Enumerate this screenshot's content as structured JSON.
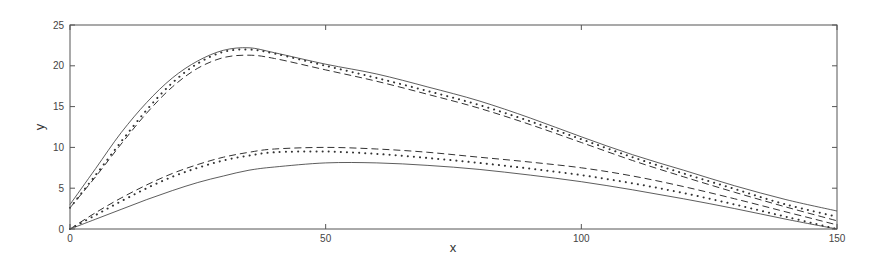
{
  "chart_data": {
    "type": "line",
    "title": "",
    "xlabel": "x",
    "ylabel": "y",
    "xlim": [
      0,
      150
    ],
    "ylim": [
      0,
      25
    ],
    "xticks": [
      0,
      50,
      100,
      150
    ],
    "yticks": [
      0,
      5,
      10,
      15,
      20,
      25
    ],
    "grid": false,
    "legend": null,
    "x": [
      0,
      5,
      10,
      15,
      20,
      25,
      30,
      35,
      40,
      50,
      60,
      70,
      80,
      90,
      100,
      110,
      120,
      130,
      140,
      150
    ],
    "series": [
      {
        "name": "upper-solid",
        "style": "solid",
        "group": "upper",
        "values": [
          3.0,
          7.4,
          11.8,
          15.5,
          18.5,
          20.6,
          21.9,
          22.2,
          21.6,
          20.2,
          19.0,
          17.4,
          15.7,
          13.6,
          11.3,
          9.1,
          7.2,
          5.3,
          3.6,
          2.2
        ]
      },
      {
        "name": "upper-dotted",
        "style": "dotted",
        "group": "upper",
        "values": [
          2.6,
          6.6,
          10.7,
          14.6,
          17.9,
          20.3,
          21.7,
          22.0,
          21.5,
          20.0,
          18.5,
          16.9,
          15.2,
          13.2,
          11.0,
          8.8,
          6.8,
          4.9,
          3.0,
          1.5
        ]
      },
      {
        "name": "upper-dashed",
        "style": "dashed",
        "group": "upper",
        "values": [
          2.6,
          6.4,
          10.4,
          14.2,
          17.4,
          19.7,
          21.0,
          21.3,
          20.9,
          19.5,
          18.1,
          16.5,
          14.8,
          12.8,
          10.6,
          8.4,
          6.4,
          4.5,
          2.7,
          1.0
        ]
      },
      {
        "name": "lower-dashed",
        "style": "dashed",
        "group": "lower",
        "values": [
          0.0,
          2.0,
          3.8,
          5.4,
          6.8,
          7.9,
          8.8,
          9.4,
          9.8,
          10.0,
          9.8,
          9.4,
          8.8,
          8.2,
          7.5,
          6.5,
          5.2,
          3.7,
          2.1,
          0.5
        ]
      },
      {
        "name": "lower-dotted",
        "style": "dotted",
        "group": "lower",
        "values": [
          0.0,
          1.7,
          3.4,
          5.0,
          6.4,
          7.5,
          8.4,
          9.0,
          9.4,
          9.5,
          9.2,
          8.7,
          8.1,
          7.4,
          6.6,
          5.6,
          4.4,
          3.0,
          1.5,
          0.0
        ]
      },
      {
        "name": "lower-solid",
        "style": "solid",
        "group": "lower",
        "values": [
          0.0,
          1.2,
          2.4,
          3.6,
          4.7,
          5.7,
          6.5,
          7.2,
          7.6,
          8.1,
          8.1,
          7.8,
          7.3,
          6.6,
          5.8,
          4.8,
          3.7,
          2.5,
          1.2,
          0.0
        ]
      }
    ]
  },
  "axes": {
    "x_label": "x",
    "y_label": "y",
    "x_tick_labels": [
      "0",
      "50",
      "100",
      "150"
    ],
    "y_tick_labels": [
      "0",
      "5",
      "10",
      "15",
      "20",
      "25"
    ]
  },
  "colors": {
    "line": "#333333",
    "axis": "#555555",
    "text": "#444444"
  }
}
